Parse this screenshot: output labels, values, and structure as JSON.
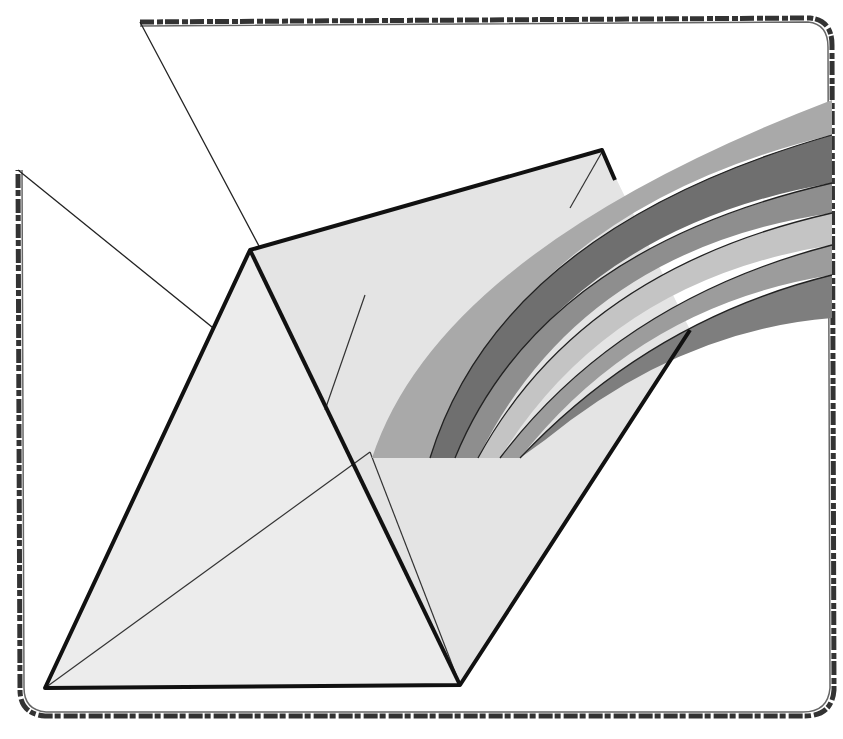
{
  "illustration": {
    "subject": "envelope with rainbow",
    "colors": {
      "background": "#ffffff",
      "envelope": "#ececec",
      "outline": "#111111",
      "rainbow_bands": [
        "#a9a9a9",
        "#6f6f6f",
        "#8e8e8e",
        "#c4c4c4",
        "#9c9c9c",
        "#7e7e7e"
      ]
    }
  }
}
